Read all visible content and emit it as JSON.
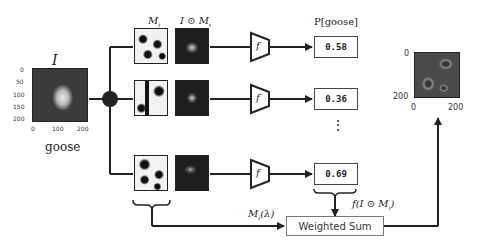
{
  "input": {
    "label": "I",
    "class_label": "goose",
    "y_ticks": [
      "0",
      "50",
      "100",
      "150",
      "200"
    ],
    "x_ticks": [
      "0",
      "100",
      "200"
    ]
  },
  "masks": {
    "mask_header": "M",
    "mask_header_sub": "i",
    "masked_header_pre": "I ⊙ M",
    "masked_header_sub": "i",
    "rows": [
      {
        "probability": "0.58"
      },
      {
        "probability": "0.36"
      },
      {
        "probability": "0.69"
      }
    ]
  },
  "model": {
    "label": "f"
  },
  "output_header": "P[goose]",
  "ellipsis": "⋮",
  "weights_label": "M",
  "weights_label_sub": "i",
  "weights_label_suffix": "(λ)",
  "scores_label": "f(I ⊙ M",
  "scores_label_sub": "i",
  "scores_label_suffix": ")",
  "weighted_sum_label": "Weighted Sum",
  "saliency": {
    "y_ticks": [
      "0",
      "200"
    ],
    "x_ticks": [
      "0",
      "200"
    ]
  },
  "colors": {
    "line": "#222222",
    "box_border": "#444444",
    "background": "#ffffff"
  }
}
